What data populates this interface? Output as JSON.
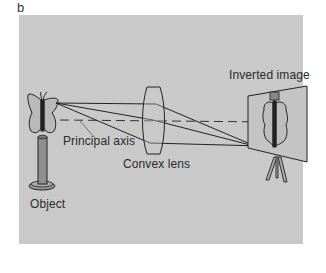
{
  "figure": {
    "panel_letter": "b",
    "background_color": "#c9c9c9",
    "labels": {
      "object": "Object",
      "principal_axis": "Principal axis",
      "convex_lens": "Convex lens",
      "inverted_image": "Inverted image"
    },
    "elements": [
      {
        "name": "object",
        "depiction": "butterfly on cylindrical stand"
      },
      {
        "name": "convex-lens",
        "depiction": "biconvex lens"
      },
      {
        "name": "screen",
        "depiction": "projection screen on tripod showing inverted butterfly"
      },
      {
        "name": "principal-axis",
        "depiction": "dashed horizontal line"
      },
      {
        "name": "light-rays",
        "count": 3
      }
    ]
  }
}
